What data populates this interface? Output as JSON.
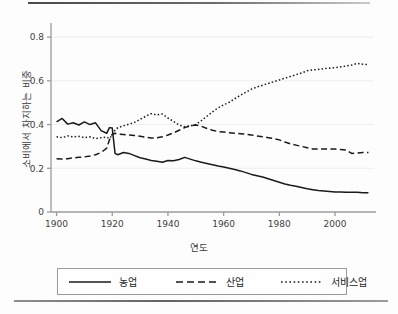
{
  "page": {
    "top_rule": "horizontal-rule",
    "bottom_rule": "horizontal-rule"
  },
  "chart_data": {
    "type": "line",
    "title": "",
    "xlabel": "연도",
    "ylabel": "소비에서 차지하는 비중",
    "xlim": [
      1898,
      2014
    ],
    "ylim": [
      0,
      0.86
    ],
    "xticks": [
      1900,
      1920,
      1940,
      1960,
      1980,
      2000
    ],
    "yticks": [
      0,
      0.2,
      0.4,
      0.6,
      0.8
    ],
    "ytick_labels": [
      "0",
      "0.2",
      "0.4",
      "0.6",
      "0.8"
    ],
    "xtick_labels": [
      "1900",
      "1920",
      "1940",
      "1960",
      "1980",
      "2000"
    ],
    "grid": "horizontal-faint",
    "legend_position": "bottom",
    "x": [
      1900,
      1902,
      1904,
      1906,
      1908,
      1910,
      1912,
      1914,
      1916,
      1918,
      1919,
      1920,
      1921,
      1922,
      1924,
      1926,
      1928,
      1930,
      1932,
      1934,
      1936,
      1938,
      1940,
      1942,
      1944,
      1946,
      1948,
      1950,
      1952,
      1954,
      1956,
      1958,
      1960,
      1962,
      1964,
      1966,
      1968,
      1970,
      1972,
      1974,
      1976,
      1978,
      1980,
      1982,
      1984,
      1986,
      1988,
      1990,
      1992,
      1994,
      1996,
      1998,
      2000,
      2002,
      2004,
      2006,
      2008,
      2010,
      2012
    ],
    "series": [
      {
        "name": "농업",
        "style": "solid",
        "color": "#1a1a1a",
        "values": [
          0.412,
          0.428,
          0.402,
          0.408,
          0.398,
          0.412,
          0.4,
          0.408,
          0.372,
          0.36,
          0.386,
          0.384,
          0.268,
          0.262,
          0.272,
          0.268,
          0.258,
          0.248,
          0.242,
          0.236,
          0.232,
          0.228,
          0.236,
          0.234,
          0.24,
          0.25,
          0.242,
          0.234,
          0.228,
          0.222,
          0.216,
          0.21,
          0.206,
          0.2,
          0.194,
          0.188,
          0.18,
          0.172,
          0.166,
          0.16,
          0.152,
          0.144,
          0.136,
          0.128,
          0.122,
          0.118,
          0.112,
          0.106,
          0.102,
          0.098,
          0.096,
          0.094,
          0.092,
          0.092,
          0.09,
          0.09,
          0.09,
          0.088,
          0.088
        ]
      },
      {
        "name": "산업",
        "style": "dashed",
        "color": "#1a1a1a",
        "values": [
          0.244,
          0.242,
          0.244,
          0.248,
          0.25,
          0.252,
          0.256,
          0.262,
          0.272,
          0.292,
          0.33,
          0.356,
          0.36,
          0.356,
          0.354,
          0.352,
          0.35,
          0.346,
          0.342,
          0.338,
          0.34,
          0.344,
          0.352,
          0.362,
          0.374,
          0.386,
          0.394,
          0.398,
          0.392,
          0.382,
          0.374,
          0.368,
          0.366,
          0.362,
          0.36,
          0.358,
          0.356,
          0.352,
          0.348,
          0.344,
          0.34,
          0.336,
          0.33,
          0.32,
          0.312,
          0.306,
          0.3,
          0.294,
          0.288,
          0.288,
          0.288,
          0.288,
          0.288,
          0.286,
          0.284,
          0.268,
          0.27,
          0.272,
          0.272
        ]
      },
      {
        "name": "서비스업",
        "style": "dotted",
        "color": "#1a1a1a",
        "values": [
          0.344,
          0.34,
          0.348,
          0.344,
          0.346,
          0.34,
          0.344,
          0.336,
          0.34,
          0.342,
          0.336,
          0.352,
          0.374,
          0.386,
          0.394,
          0.402,
          0.41,
          0.424,
          0.438,
          0.45,
          0.444,
          0.448,
          0.43,
          0.414,
          0.398,
          0.39,
          0.394,
          0.4,
          0.418,
          0.438,
          0.458,
          0.476,
          0.49,
          0.502,
          0.518,
          0.534,
          0.548,
          0.562,
          0.572,
          0.58,
          0.588,
          0.596,
          0.604,
          0.612,
          0.62,
          0.628,
          0.636,
          0.646,
          0.65,
          0.652,
          0.656,
          0.658,
          0.66,
          0.664,
          0.668,
          0.672,
          0.68,
          0.676,
          0.674
        ]
      }
    ],
    "legend": [
      {
        "label": "농업",
        "style": "solid"
      },
      {
        "label": "산업",
        "style": "dashed"
      },
      {
        "label": "서비스업",
        "style": "dotted"
      }
    ]
  }
}
